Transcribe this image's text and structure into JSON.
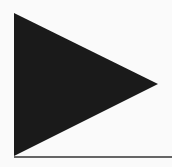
{
  "diagram": {
    "background": "#fafafa",
    "triangle": {
      "shape": "right-pointing-triangle",
      "fill": "#1a1a1a",
      "points": [
        [
          14,
          13
        ],
        [
          158,
          84
        ],
        [
          14,
          156
        ]
      ]
    },
    "baseline": {
      "color": "#333333",
      "x1": 14,
      "y1": 157,
      "x2": 172,
      "y2": 157,
      "width": 1.5
    }
  }
}
